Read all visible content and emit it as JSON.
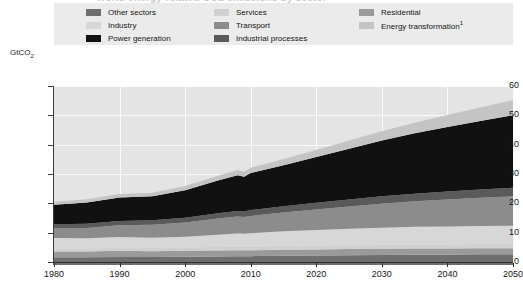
{
  "figure": {
    "ghost_title": "World energy-related CO2 emissions by sector"
  },
  "legend": {
    "columns": [
      {
        "items": [
          {
            "label": "Other sectors",
            "color": "#6e6e6e",
            "key": "other_sectors"
          },
          {
            "label": "Industry",
            "color": "#d7d7d7",
            "key": "industry"
          },
          {
            "label": "Power generation",
            "color": "#111111",
            "key": "power_generation"
          }
        ]
      },
      {
        "items": [
          {
            "label": "Services",
            "color": "#d0d0d0",
            "key": "services"
          },
          {
            "label": "Transport",
            "color": "#8c8c8c",
            "key": "transport"
          },
          {
            "label": "Industrial processes",
            "color": "#5a5a5a",
            "key": "industrial_processes"
          }
        ]
      },
      {
        "items": [
          {
            "label": "Residential",
            "label_sup": "",
            "color": "#9a9a9a",
            "key": "residential"
          },
          {
            "label": "Energy transformation",
            "label_sup": "1",
            "color": "#c4c4c4",
            "key": "energy_transformation"
          }
        ]
      }
    ]
  },
  "axis": {
    "y_title": "GtCO",
    "y_title_sub": "2",
    "y_ticks": [
      0,
      10,
      20,
      30,
      40,
      50,
      60
    ],
    "x_ticks": [
      1980,
      1990,
      2000,
      2010,
      2020,
      2030,
      2040,
      2050
    ]
  },
  "watermark": {
    "text": "www.iea.org"
  },
  "chart_data": {
    "type": "area",
    "title": "World energy-related CO2 emissions by sector",
    "xlabel": "",
    "ylabel": "GtCO2",
    "xlim": [
      1980,
      2050
    ],
    "ylim": [
      0,
      60
    ],
    "grid": true,
    "legend_position": "top",
    "stacked": true,
    "x": [
      1980,
      1985,
      1990,
      1995,
      2000,
      2005,
      2008,
      2009,
      2010,
      2015,
      2020,
      2025,
      2030,
      2035,
      2040,
      2045,
      2050
    ],
    "series": [
      {
        "name": "Other sectors",
        "color": "#6e6e6e",
        "values": [
          1.6,
          1.6,
          1.7,
          1.7,
          1.8,
          1.9,
          2.0,
          2.0,
          2.0,
          2.1,
          2.2,
          2.3,
          2.4,
          2.5,
          2.5,
          2.6,
          2.6
        ]
      },
      {
        "name": "Residential",
        "color": "#9a9a9a",
        "values": [
          2.0,
          2.0,
          2.1,
          2.0,
          2.0,
          2.0,
          2.0,
          2.0,
          2.0,
          2.1,
          2.1,
          2.1,
          2.1,
          2.1,
          2.1,
          2.1,
          2.1
        ]
      },
      {
        "name": "Services",
        "color": "#d0d0d0",
        "values": [
          1.0,
          1.0,
          1.1,
          1.1,
          1.2,
          1.2,
          1.2,
          1.2,
          1.2,
          1.3,
          1.3,
          1.3,
          1.4,
          1.4,
          1.4,
          1.4,
          1.4
        ]
      },
      {
        "name": "Industry",
        "color": "#d7d7d7",
        "values": [
          3.6,
          3.5,
          3.6,
          3.5,
          3.6,
          4.2,
          4.5,
          4.4,
          4.6,
          5.0,
          5.3,
          5.6,
          5.8,
          6.0,
          6.1,
          6.2,
          6.3
        ]
      },
      {
        "name": "Transport",
        "color": "#8c8c8c",
        "values": [
          3.3,
          3.5,
          4.0,
          4.4,
          4.9,
          5.5,
          5.8,
          5.7,
          5.9,
          6.4,
          7.0,
          7.6,
          8.2,
          8.7,
          9.2,
          9.6,
          10.0
        ]
      },
      {
        "name": "Industrial processes",
        "color": "#5a5a5a",
        "values": [
          1.4,
          1.4,
          1.5,
          1.5,
          1.6,
          1.8,
          1.9,
          1.9,
          2.0,
          2.1,
          2.3,
          2.4,
          2.5,
          2.6,
          2.7,
          2.8,
          2.9
        ]
      },
      {
        "name": "Power generation",
        "color": "#111111",
        "values": [
          6.6,
          7.3,
          8.0,
          8.2,
          9.4,
          11.2,
          12.2,
          11.9,
          12.6,
          14.0,
          15.6,
          17.3,
          19.0,
          20.6,
          22.0,
          23.4,
          24.7
        ]
      },
      {
        "name": "Energy transformation",
        "color": "#c4c4c4",
        "values": [
          1.0,
          1.1,
          1.2,
          1.2,
          1.4,
          1.6,
          1.8,
          1.7,
          1.8,
          2.1,
          2.4,
          2.8,
          3.2,
          3.6,
          4.1,
          4.6,
          5.2
        ]
      }
    ],
    "totals": [
      20.5,
      21.4,
      23.2,
      23.6,
      25.9,
      29.4,
      31.4,
      30.8,
      32.1,
      35.1,
      38.2,
      41.4,
      44.6,
      47.5,
      50.1,
      52.7,
      55.2
    ]
  }
}
